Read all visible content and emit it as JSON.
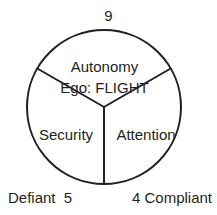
{
  "diagram": {
    "type": "enneagram-triad-circle",
    "stroke_color": "#231f20",
    "background_color": "#ffffff",
    "circle": {
      "center_x": 104,
      "center_y": 107,
      "radius": 77
    },
    "labels": {
      "top_number": "9",
      "sector_top_title": "Autonomy",
      "sector_top_subtitle": "Ego: FLIGHT",
      "sector_lower_left": "Security",
      "sector_lower_right": "Attention",
      "bottom_left": "Defiant  5",
      "bottom_right": "4 Compliant"
    },
    "dividers": [
      {
        "name": "upper-left-divider",
        "angle_degrees": 150
      },
      {
        "name": "upper-right-divider",
        "angle_degrees": 30
      },
      {
        "name": "bottom-divider",
        "angle_degrees": 270
      }
    ]
  }
}
